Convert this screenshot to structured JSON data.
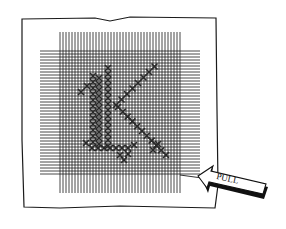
{
  "illustration": {
    "subject": "cross-stitch canvas with monogram letter",
    "monogram_letter": "K",
    "arrow": {
      "label": "PULL",
      "direction": "left"
    },
    "colors": {
      "ink": "#1a1a1a",
      "paper": "#ffffff",
      "stitch": "#333333"
    }
  }
}
